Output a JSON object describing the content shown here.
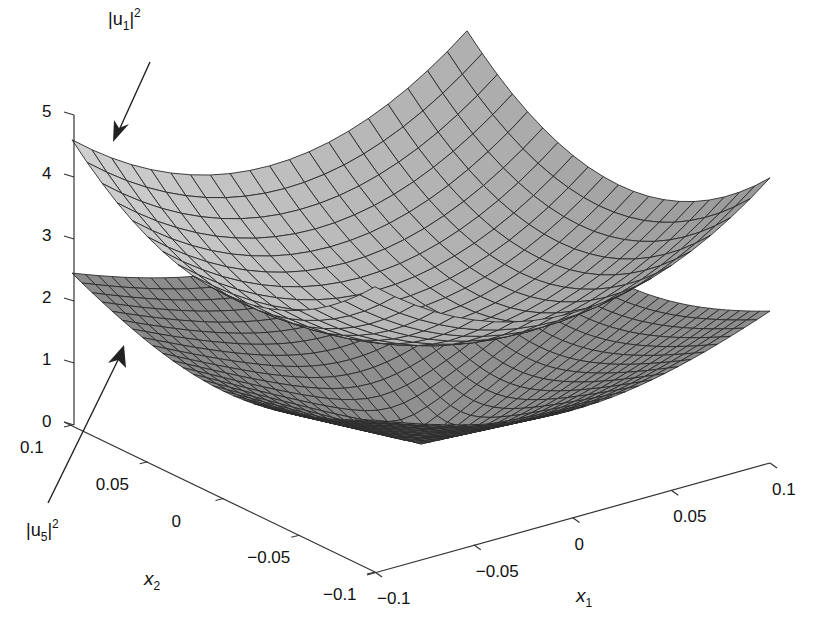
{
  "chart_data": {
    "type": "surface3d",
    "title": "",
    "xlabel": "x1",
    "ylabel": "x2",
    "zlabel": "",
    "x1_range": [
      -0.1,
      0.1
    ],
    "x2_range": [
      -0.1,
      0.1
    ],
    "zlim": [
      0,
      5
    ],
    "x1_ticks": [
      "-0.1",
      "-0.05",
      "0",
      "0.05",
      "0.1"
    ],
    "x2_ticks": [
      "-0.1",
      "-0.05",
      "0",
      "0.05",
      "0.1"
    ],
    "z_ticks": [
      "0",
      "1",
      "2",
      "3",
      "4",
      "5"
    ],
    "grid": false,
    "series": [
      {
        "name": "|u1|^2",
        "shape": "paraboloid",
        "center_value": 2.0,
        "corner_value": 4.6,
        "mesh": 20,
        "face_color": "#b4b4b4",
        "edge_color": "#2a2a2a"
      },
      {
        "name": "|u5|^2",
        "shape": "cone",
        "center_value": 0.0,
        "corner_value": 2.45,
        "mesh": 30,
        "face_color": "#8c8c8c",
        "edge_color": "#2a2a2a"
      }
    ],
    "annotations": [
      {
        "text": "|u1|^2",
        "points_to": "upper surface"
      },
      {
        "text": "|u5|^2",
        "points_to": "lower surface"
      }
    ]
  },
  "labels": {
    "u1": {
      "base": "|u",
      "sub": "1",
      "tail": "|",
      "sup": "2"
    },
    "u5": {
      "base": "|u",
      "sub": "5",
      "tail": "|",
      "sup": "2"
    },
    "x1": {
      "base": "x",
      "sub": "1"
    },
    "x2": {
      "base": "x",
      "sub": "2"
    },
    "minus_sign": "−"
  }
}
